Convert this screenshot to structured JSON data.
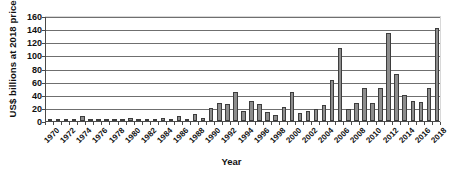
{
  "chart_data": {
    "type": "bar",
    "title": "",
    "xlabel": "Year",
    "ylabel": "US$ billions at 2018 prices",
    "ylim": [
      0,
      160
    ],
    "yticks": [
      0,
      20,
      40,
      60,
      80,
      100,
      120,
      140,
      160
    ],
    "grid": true,
    "legend": "none",
    "xtick_labels": [
      "1970",
      "1972",
      "1974",
      "1976",
      "1978",
      "1980",
      "1982",
      "1984",
      "1986",
      "1988",
      "1990",
      "1992",
      "1994",
      "1996",
      "1998",
      "2000",
      "2002",
      "2004",
      "2006",
      "2008",
      "2010",
      "2012",
      "2014",
      "2016",
      "2018"
    ],
    "xtick_step": 2,
    "categories": [
      "1970",
      "1971",
      "1972",
      "1973",
      "1974",
      "1975",
      "1976",
      "1977",
      "1978",
      "1979",
      "1980",
      "1981",
      "1982",
      "1983",
      "1984",
      "1985",
      "1986",
      "1987",
      "1988",
      "1989",
      "1990",
      "1991",
      "1992",
      "1993",
      "1994",
      "1995",
      "1996",
      "1997",
      "1998",
      "1999",
      "2000",
      "2001",
      "2002",
      "2003",
      "2004",
      "2005",
      "2006",
      "2007",
      "2008",
      "2009",
      "2010",
      "2011",
      "2012",
      "2013",
      "2014",
      "2015",
      "2016",
      "2017",
      "2018"
    ],
    "values": [
      2,
      1,
      2,
      3,
      7,
      2,
      2,
      2,
      1,
      2,
      5,
      1,
      1,
      2,
      5,
      3,
      7,
      2,
      11,
      4,
      20,
      28,
      26,
      44,
      15,
      31,
      26,
      13,
      9,
      22,
      44,
      12,
      15,
      18,
      24,
      62,
      111,
      18,
      28,
      50,
      27,
      50,
      134,
      72,
      39,
      31,
      29,
      50,
      142
    ],
    "series_name": "",
    "bar_color": "#8d8d8d",
    "bar_edge_color": "#3d3d3d",
    "gridline_color": "#6f6f6f",
    "axis_color": "#4a4a4a"
  }
}
